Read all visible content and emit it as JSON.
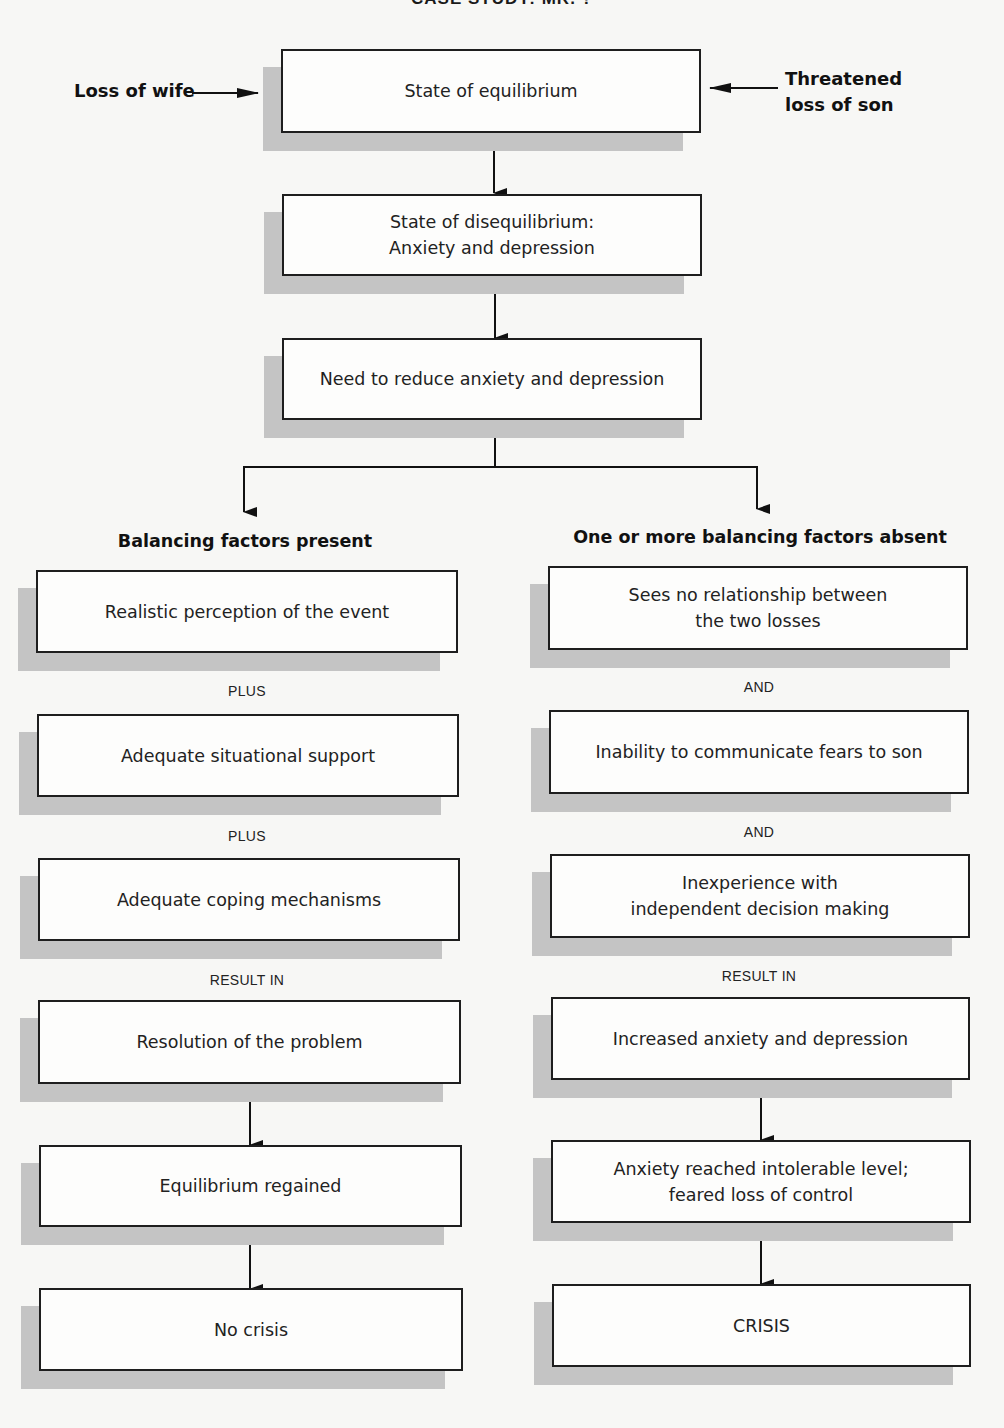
{
  "title": "CASE STUDY: MR. ?",
  "inputs": {
    "left": "Loss of wife",
    "right": "Threatened\nloss of son"
  },
  "main_chain": [
    {
      "id": "equilibrium",
      "text": "State of equilibrium"
    },
    {
      "id": "disequilibrium",
      "text": "State of disequilibrium:\nAnxiety and depression"
    },
    {
      "id": "need",
      "text": "Need to reduce anxiety and depression"
    }
  ],
  "branches": {
    "left": {
      "header": "Balancing factors present",
      "nodes": [
        "Realistic perception of the event",
        "Adequate situational support",
        "Adequate coping mechanisms",
        "Resolution of the problem",
        "Equilibrium regained",
        "No crisis"
      ],
      "connectors": [
        "PLUS",
        "PLUS",
        "RESULT IN"
      ]
    },
    "right": {
      "header": "One or more balancing factors absent",
      "nodes": [
        "Sees no relationship between\nthe two losses",
        "Inability to communicate fears to son",
        "Inexperience with\nindependent decision making",
        "Increased anxiety and depression",
        "Anxiety reached intolerable level;\nfeared loss of control",
        "CRISIS"
      ],
      "connectors": [
        "AND",
        "AND",
        "RESULT IN"
      ]
    }
  },
  "colors": {
    "background": "#f7f7f5",
    "box_border": "#1e1e1e",
    "shadow": "#c4c4c4"
  }
}
